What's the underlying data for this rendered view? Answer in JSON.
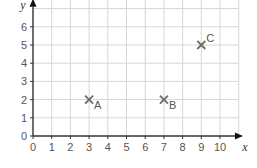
{
  "chart_data": {
    "type": "scatter",
    "title": "",
    "xlabel": "x",
    "ylabel": "y",
    "xlim": [
      0,
      10
    ],
    "ylim": [
      0,
      6
    ],
    "x_ticks": [
      "0",
      "1",
      "2",
      "3",
      "4",
      "5",
      "6",
      "7",
      "8",
      "9",
      "10"
    ],
    "y_ticks": [
      "0",
      "1",
      "2",
      "3",
      "4",
      "5",
      "6"
    ],
    "grid": true,
    "marker": "x",
    "points": [
      {
        "label": "A",
        "x": 3,
        "y": 2
      },
      {
        "label": "B",
        "x": 7,
        "y": 2
      },
      {
        "label": "C",
        "x": 9,
        "y": 5
      }
    ],
    "colors": {
      "grid": "#d6d6d6",
      "axis": "#333333",
      "marker": "#6e6e6e",
      "text": "#555555"
    }
  }
}
